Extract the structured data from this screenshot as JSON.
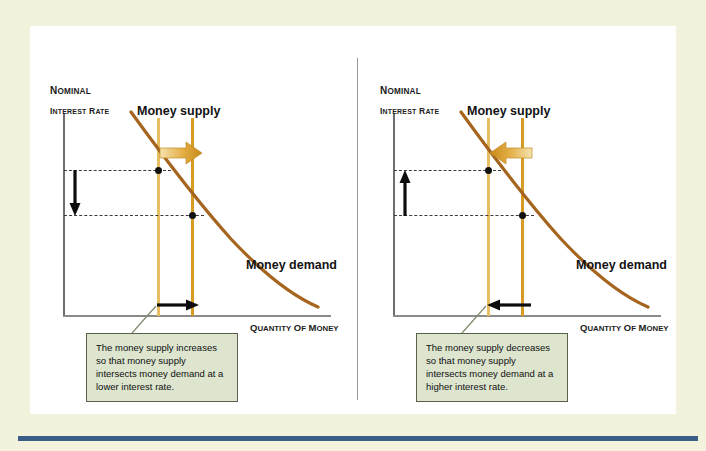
{
  "figure": {
    "background_color": "#f3f2dd",
    "panel_color": "#ffffff",
    "rule_color": "#3a5e88",
    "divider_color": "#9a9a96"
  },
  "colors": {
    "supply_pale": "#e8be63",
    "supply_dark": "#d79a24",
    "demand_curve": "#a5651f",
    "block_arrow": "#d9a63c",
    "callout_fill": "#dde5cf",
    "callout_border": "#59604d",
    "axis": "#6e6e6e",
    "marker": "#111111"
  },
  "panels": [
    {
      "id": "left",
      "y_axis_label_line1": "NOMINAL",
      "y_axis_label_line2": "INTEREST RATE",
      "x_axis_label": "QUANTITY OF MONEY",
      "supply_label": "Money supply",
      "demand_label": "Money demand",
      "shift_direction": "right",
      "rate_arrow_direction": "down",
      "quantity_arrow_direction": "right",
      "caption": "The money supply increases so that money supply intersects money demand at a lower interest rate."
    },
    {
      "id": "right",
      "y_axis_label_line1": "NOMINAL",
      "y_axis_label_line2": "INTEREST RATE",
      "x_axis_label": "QUANTITY OF MONEY",
      "supply_label": "Money supply",
      "demand_label": "Money demand",
      "shift_direction": "left",
      "rate_arrow_direction": "up",
      "quantity_arrow_direction": "left",
      "caption": "The money supply decreases so that money supply intersects money demand at a higher interest rate."
    }
  ],
  "chart_data": {
    "type": "line",
    "xlabel": "QUANTITY OF MONEY",
    "ylabel": "NOMINAL INTEREST RATE",
    "grid": false,
    "legend": "inline-labels",
    "xlim": [
      0,
      100
    ],
    "ylim": [
      0,
      100
    ],
    "panels": [
      {
        "name": "Money supply increases",
        "series": [
          {
            "name": "Money demand",
            "type": "curve",
            "points": [
              {
                "x": 26,
                "y": 100
              },
              {
                "x": 32,
                "y": 78
              },
              {
                "x": 40,
                "y": 60
              },
              {
                "x": 50,
                "y": 45
              },
              {
                "x": 62,
                "y": 31
              },
              {
                "x": 75,
                "y": 19
              },
              {
                "x": 88,
                "y": 10
              },
              {
                "x": 100,
                "y": 4
              }
            ]
          },
          {
            "name": "Money supply (original)",
            "type": "vertical-line",
            "x": 36,
            "style": "pale"
          },
          {
            "name": "Money supply (new)",
            "type": "vertical-line",
            "x": 48,
            "style": "dark"
          }
        ],
        "equilibria": [
          {
            "label": "original",
            "x": 36,
            "y": 70
          },
          {
            "label": "new",
            "x": 48,
            "y": 48
          }
        ],
        "annotations": [
          {
            "kind": "block-arrow",
            "direction": "right",
            "meaning": "money supply shifts right"
          },
          {
            "kind": "arrow",
            "direction": "down",
            "meaning": "interest rate falls"
          },
          {
            "kind": "arrow",
            "direction": "right",
            "meaning": "quantity of money rises"
          }
        ]
      },
      {
        "name": "Money supply decreases",
        "series": [
          {
            "name": "Money demand",
            "type": "curve",
            "points": [
              {
                "x": 26,
                "y": 100
              },
              {
                "x": 32,
                "y": 78
              },
              {
                "x": 40,
                "y": 60
              },
              {
                "x": 50,
                "y": 45
              },
              {
                "x": 62,
                "y": 31
              },
              {
                "x": 75,
                "y": 19
              },
              {
                "x": 88,
                "y": 10
              },
              {
                "x": 100,
                "y": 4
              }
            ]
          },
          {
            "name": "Money supply (new)",
            "type": "vertical-line",
            "x": 36,
            "style": "pale"
          },
          {
            "name": "Money supply (original)",
            "type": "vertical-line",
            "x": 48,
            "style": "dark"
          }
        ],
        "equilibria": [
          {
            "label": "new",
            "x": 36,
            "y": 70
          },
          {
            "label": "original",
            "x": 48,
            "y": 48
          }
        ],
        "annotations": [
          {
            "kind": "block-arrow",
            "direction": "left",
            "meaning": "money supply shifts left"
          },
          {
            "kind": "arrow",
            "direction": "up",
            "meaning": "interest rate rises"
          },
          {
            "kind": "arrow",
            "direction": "left",
            "meaning": "quantity of money falls"
          }
        ]
      }
    ]
  }
}
